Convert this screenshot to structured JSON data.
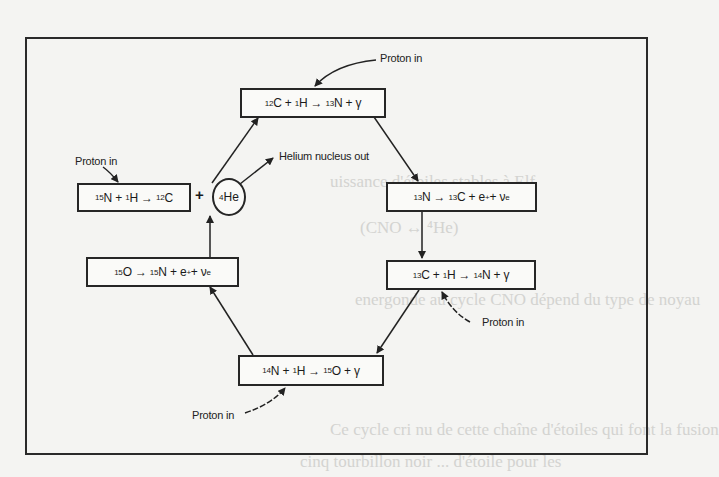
{
  "background_bleed_text": [
    "uissance d'étoiles stables à Elf",
    "(CNO ↔ ⁴He)",
    "energonde au cycle CNO dépend du type de noyau",
    "Ce cycle cri nu de cette chaîne d'étoiles qui font la fusion",
    "cinq tourbillon noir ... d'étoile pour les"
  ],
  "diagram": {
    "reactions": [
      {
        "id": "r1",
        "parts": [
          {
            "sup": "12",
            "t": "C + "
          },
          {
            "sup": "1",
            "t": "H → "
          },
          {
            "sup": "13",
            "t": "N + γ"
          }
        ]
      },
      {
        "id": "r2",
        "parts": [
          {
            "sup": "13",
            "t": "N → "
          },
          {
            "sup": "13",
            "t": "C + e"
          },
          {
            "supx": "+",
            "t": " + ν"
          },
          {
            "sub": "e",
            "t": ""
          }
        ]
      },
      {
        "id": "r3",
        "parts": [
          {
            "sup": "13",
            "t": "C + "
          },
          {
            "sup": "1",
            "t": "H → "
          },
          {
            "sup": "14",
            "t": "N + γ"
          }
        ]
      },
      {
        "id": "r4",
        "parts": [
          {
            "sup": "14",
            "t": "N + "
          },
          {
            "sup": "1",
            "t": "H → "
          },
          {
            "sup": "15",
            "t": "O + γ"
          }
        ]
      },
      {
        "id": "r5",
        "parts": [
          {
            "sup": "15",
            "t": "O → "
          },
          {
            "sup": "15",
            "t": "N + e"
          },
          {
            "supx": "+",
            "t": " + ν"
          },
          {
            "sub": "e",
            "t": ""
          }
        ]
      },
      {
        "id": "r6",
        "parts": [
          {
            "sup": "15",
            "t": "N + "
          },
          {
            "sup": "1",
            "t": "H → "
          },
          {
            "sup": "12",
            "t": "C"
          }
        ]
      }
    ],
    "plus_sign": "+",
    "helium": {
      "sup": "4",
      "t": "He"
    },
    "labels": {
      "proton_in_top": "Proton in",
      "proton_in_left": "Proton in",
      "proton_in_right": "Proton in",
      "proton_in_bottom": "Proton in",
      "helium_out": "Helium nucleus out"
    }
  }
}
